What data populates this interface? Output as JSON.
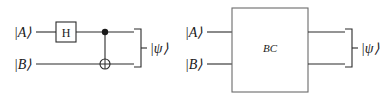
{
  "figure": {
    "background_color": "#ffffff",
    "line_color": "#2b2b2b",
    "box_outline_color": "#6b6b6b",
    "width": 392,
    "height": 96
  },
  "left_circuit": {
    "name": "explicit-gate-circuit",
    "inputs": [
      {
        "label": "|A⟩",
        "wire": "top"
      },
      {
        "label": "|B⟩",
        "wire": "bottom"
      }
    ],
    "gates": [
      {
        "type": "hadamard",
        "label": "H",
        "wire": "top"
      },
      {
        "type": "cnot",
        "control_wire": "top",
        "target_wire": "bottom",
        "target_symbol": "⊕"
      }
    ],
    "output": {
      "label": "|ψ⟩",
      "bracket": "right-curly-brace"
    }
  },
  "right_circuit": {
    "name": "black-box-circuit",
    "inputs": [
      {
        "label": "|A⟩",
        "wire": "top"
      },
      {
        "label": "|B⟩",
        "wire": "bottom"
      }
    ],
    "gates": [
      {
        "type": "black-box",
        "label": "BC"
      }
    ],
    "output": {
      "label": "|ψ⟩",
      "bracket": "right-curly-brace"
    }
  }
}
